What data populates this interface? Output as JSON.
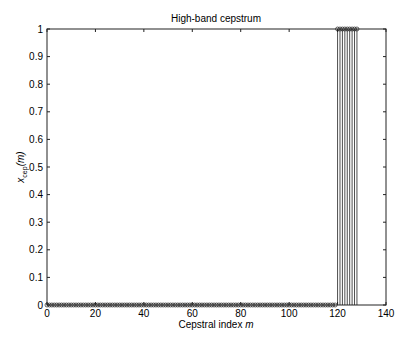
{
  "chart_data": {
    "type": "stem",
    "title": "High-band cepstrum",
    "xlabel": "Cepstral index m",
    "xlabel_parts": {
      "text": "Cepstral index ",
      "var": "m"
    },
    "ylabel": "x_cep(m)",
    "ylabel_parts": {
      "base": "x",
      "sub": "cep",
      "arg": "(m)"
    },
    "xlim": [
      0,
      140
    ],
    "ylim": [
      0,
      1
    ],
    "xticks": [
      0,
      20,
      40,
      60,
      80,
      100,
      120,
      140
    ],
    "yticks": [
      0,
      0.1,
      0.2,
      0.3,
      0.4,
      0.5,
      0.6,
      0.7,
      0.8,
      0.9,
      1
    ],
    "ytick_labels": [
      "0",
      "0.1",
      "0.2",
      "0.3",
      "0.4",
      "0.5",
      "0.6",
      "0.7",
      "0.8",
      "0.9",
      "1"
    ],
    "grid": false,
    "legend": null,
    "series": [
      {
        "name": "x_cep(m)",
        "marker": "circle-open",
        "segments": [
          {
            "x_start": 0,
            "x_end": 119,
            "value": 0
          },
          {
            "x_start": 120,
            "x_end": 128,
            "value": 1
          }
        ]
      }
    ]
  }
}
